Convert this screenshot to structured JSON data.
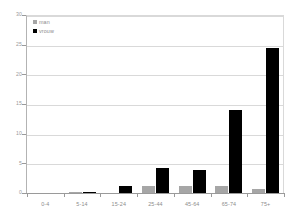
{
  "chart_data": {
    "type": "bar",
    "title": "",
    "xlabel": "",
    "ylabel": "",
    "ylim": [
      0,
      30
    ],
    "yticks": [
      0,
      5,
      10,
      15,
      20,
      25,
      30
    ],
    "ytick_labels": [
      "0",
      "5",
      "10",
      "15",
      "20",
      "25",
      "30"
    ],
    "grid": true,
    "legend_position": "top-left",
    "categories": [
      "0-4",
      "5-14",
      "15-24",
      "25-44",
      "45-64",
      "65-74",
      "75+"
    ],
    "series": [
      {
        "name": "man",
        "color": "#a6a6a6",
        "values": [
          0,
          0.15,
          0,
          1.1,
          1.2,
          1.2,
          0.7
        ]
      },
      {
        "name": "vrouw",
        "color": "#000000",
        "values": [
          0,
          0.15,
          1.1,
          4.3,
          3.9,
          14.0,
          24.5
        ]
      }
    ]
  },
  "legend": {
    "items": [
      {
        "label": "man",
        "swatch": "man"
      },
      {
        "label": "vrouw",
        "swatch": "vrouw"
      }
    ]
  },
  "colors": {
    "man": "#a6a6a6",
    "vrouw": "#000000",
    "gridline": "#d9d9d9",
    "axis": "#9a9a9a",
    "text": "#8c8c8c",
    "background": "#ffffff"
  }
}
